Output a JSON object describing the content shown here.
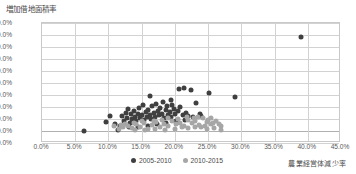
{
  "chart_data": {
    "type": "scatter",
    "title": "",
    "xlabel": "農業経営体減少率",
    "ylabel": "増加借地面積率",
    "xlim": [
      0,
      45
    ],
    "ylim": [
      -20,
      180
    ],
    "xtick_labels": [
      "0.0%",
      "5.0%",
      "10.0%",
      "15.0%",
      "20.0%",
      "25.0%",
      "30.0%",
      "35.0%",
      "40.0%",
      "45.0%"
    ],
    "xticks": [
      0,
      5,
      10,
      15,
      20,
      25,
      30,
      35,
      40,
      45
    ],
    "ytick_labels": [
      "180.0%",
      "160.0%",
      "140.0%",
      "120.0%",
      "100.0%",
      "80.0%",
      "60.0%",
      "40.0%",
      "20.0%",
      "0.0%",
      "-20.0%"
    ],
    "yticks": [
      180,
      160,
      140,
      120,
      100,
      80,
      60,
      40,
      20,
      0,
      -20
    ],
    "grid": true,
    "legend_position": "bottom",
    "colors": {
      "series_0": "#3f3f3f",
      "series_1": "#a6a6a6"
    },
    "series": [
      {
        "name": "2005-2010",
        "color": "#3f3f3f",
        "points": [
          [
            6.3,
            0.5
          ],
          [
            9.6,
            15.0
          ],
          [
            10.2,
            25.0
          ],
          [
            11.0,
            11.0
          ],
          [
            11.4,
            2.0
          ],
          [
            12.0,
            25.0
          ],
          [
            12.3,
            17.0
          ],
          [
            12.6,
            30.0
          ],
          [
            12.8,
            22.0
          ],
          [
            13.0,
            36.0
          ],
          [
            13.2,
            14.0
          ],
          [
            13.4,
            28.0
          ],
          [
            13.6,
            20.0
          ],
          [
            13.8,
            33.0
          ],
          [
            14.0,
            24.0
          ],
          [
            14.2,
            16.0
          ],
          [
            14.4,
            29.0
          ],
          [
            14.6,
            38.0
          ],
          [
            14.8,
            21.0
          ],
          [
            15.0,
            26.0
          ],
          [
            15.2,
            43.0
          ],
          [
            15.4,
            18.0
          ],
          [
            15.6,
            31.0
          ],
          [
            15.8,
            24.0
          ],
          [
            16.0,
            35.0
          ],
          [
            16.2,
            27.0
          ],
          [
            16.4,
            20.0
          ],
          [
            16.6,
            41.0
          ],
          [
            16.8,
            30.0
          ],
          [
            17.0,
            23.0
          ],
          [
            17.2,
            45.0
          ],
          [
            17.4,
            33.0
          ],
          [
            17.6,
            26.0
          ],
          [
            17.8,
            38.0
          ],
          [
            18.0,
            29.0
          ],
          [
            18.2,
            48.0
          ],
          [
            18.4,
            22.0
          ],
          [
            18.6,
            35.0
          ],
          [
            18.8,
            42.0
          ],
          [
            19.0,
            27.0
          ],
          [
            19.2,
            31.0
          ],
          [
            19.4,
            24.0
          ],
          [
            19.6,
            44.0
          ],
          [
            19.8,
            36.0
          ],
          [
            20.0,
            28.0
          ],
          [
            20.4,
            33.0
          ],
          [
            20.8,
            40.0
          ],
          [
            21.2,
            26.0
          ],
          [
            21.6,
            30.0
          ],
          [
            22.0,
            25.0
          ],
          [
            16.3,
            58.0
          ],
          [
            19.4,
            52.0
          ],
          [
            20.6,
            70.0
          ],
          [
            21.4,
            72.0
          ],
          [
            22.4,
            68.0
          ],
          [
            23.2,
            46.0
          ],
          [
            24.0,
            25.0
          ],
          [
            25.2,
            63.0
          ],
          [
            29.0,
            56.0
          ],
          [
            39.0,
            157.0
          ],
          [
            11.8,
            8.0
          ],
          [
            13.1,
            7.0
          ],
          [
            14.5,
            6.0
          ],
          [
            15.9,
            9.0
          ],
          [
            17.3,
            11.0
          ],
          [
            18.7,
            13.0
          ],
          [
            20.1,
            16.0
          ],
          [
            21.5,
            19.0
          ],
          [
            22.8,
            23.0
          ],
          [
            23.8,
            29.0
          ]
        ]
      },
      {
        "name": "2010-2015",
        "color": "#a6a6a6",
        "points": [
          [
            10.8,
            8.0
          ],
          [
            11.6,
            3.0
          ],
          [
            12.2,
            6.0
          ],
          [
            12.9,
            9.0
          ],
          [
            13.5,
            5.0
          ],
          [
            14.1,
            11.0
          ],
          [
            14.7,
            7.0
          ],
          [
            15.3,
            13.0
          ],
          [
            15.9,
            4.0
          ],
          [
            16.5,
            10.0
          ],
          [
            17.1,
            15.0
          ],
          [
            17.7,
            6.0
          ],
          [
            18.3,
            12.0
          ],
          [
            18.9,
            8.0
          ],
          [
            19.5,
            17.0
          ],
          [
            20.1,
            11.0
          ],
          [
            20.7,
            14.0
          ],
          [
            21.3,
            9.0
          ],
          [
            21.9,
            19.0
          ],
          [
            22.5,
            13.0
          ],
          [
            23.1,
            16.0
          ],
          [
            23.7,
            10.0
          ],
          [
            24.3,
            21.0
          ],
          [
            24.9,
            15.0
          ],
          [
            25.5,
            12.0
          ],
          [
            14.0,
            2.0
          ],
          [
            15.5,
            1.5
          ],
          [
            17.0,
            3.0
          ],
          [
            18.5,
            2.5
          ],
          [
            20.0,
            4.0
          ],
          [
            21.0,
            6.5
          ],
          [
            22.0,
            5.0
          ],
          [
            23.0,
            7.5
          ],
          [
            24.0,
            6.0
          ],
          [
            24.6,
            9.0
          ],
          [
            25.0,
            18.0
          ],
          [
            25.4,
            22.0
          ],
          [
            25.8,
            14.0
          ],
          [
            26.2,
            17.0
          ],
          [
            19.0,
            22.0
          ],
          [
            20.5,
            20.0
          ],
          [
            21.8,
            23.0
          ],
          [
            22.9,
            21.0
          ],
          [
            23.5,
            24.0
          ],
          [
            18.0,
            19.0
          ],
          [
            16.8,
            17.0
          ],
          [
            15.0,
            16.0
          ],
          [
            13.8,
            14.0
          ],
          [
            12.5,
            12.0
          ],
          [
            11.9,
            10.0
          ],
          [
            26.6,
            11.0
          ],
          [
            27.0,
            8.0
          ],
          [
            25.9,
            5.0
          ],
          [
            24.8,
            3.0
          ],
          [
            26.9,
            2.0
          ]
        ]
      }
    ]
  },
  "legend": {
    "items": [
      {
        "label": "2005-2010"
      },
      {
        "label": "2010-2015"
      }
    ]
  }
}
